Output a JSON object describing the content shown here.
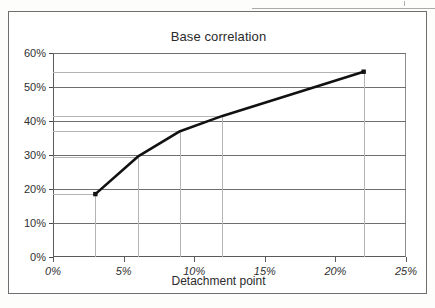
{
  "chart_data": {
    "type": "line",
    "title": "Base correlation",
    "xlabel": "Detachment point",
    "ylabel": "",
    "xlim": [
      0,
      25
    ],
    "ylim": [
      0,
      60
    ],
    "grid": "horizontal-major-plus-point-leader-lines",
    "legend": "none",
    "x_tick_labels": [
      "0%",
      "5%",
      "10%",
      "15%",
      "20%",
      "25%"
    ],
    "x_tick_values": [
      0,
      5,
      10,
      15,
      20,
      25
    ],
    "y_tick_labels": [
      "0%",
      "10%",
      "20%",
      "30%",
      "40%",
      "50%",
      "60%"
    ],
    "y_tick_values": [
      0,
      10,
      20,
      30,
      40,
      50,
      60
    ],
    "x": [
      3,
      6,
      9,
      12,
      22
    ],
    "values": [
      18.5,
      29.5,
      37,
      41.5,
      54.5
    ],
    "point_labels": [
      "3%, 18.5%",
      "6%, 29.5%",
      "9%, 37%",
      "12%, 41.5%",
      "22%, 54.5%"
    ],
    "series": [
      {
        "name": "Base correlation",
        "x": [
          3,
          6,
          9,
          12,
          22
        ],
        "values": [
          18.5,
          29.5,
          37,
          41.5,
          54.5
        ],
        "color": "#111111"
      }
    ]
  },
  "chart": {
    "title": "Base correlation",
    "x_axis_title": "Detachment point",
    "series_color": "#111111",
    "gridline_color": "#6e6e6e",
    "leader_line_color": "#b4b4b4",
    "frame_color": "#6f6f6f"
  }
}
